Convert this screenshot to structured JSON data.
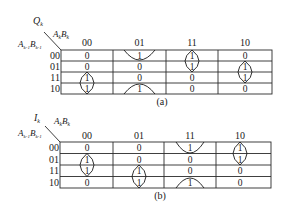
{
  "maps": [
    {
      "id": "a",
      "output_var": "Q",
      "output_sub": "k",
      "col_var": "A",
      "col_var_sub": "k",
      "col_var2": "B",
      "col_var2_sub": "k",
      "row_var": "A",
      "row_var_sub": "k-1",
      "row_var2": "B",
      "row_var2_sub": "k-1",
      "col_headers": [
        "00",
        "01",
        "11",
        "10"
      ],
      "row_headers": [
        "00",
        "01",
        "11",
        "10"
      ],
      "cells": [
        [
          "0",
          "1",
          "1",
          "0"
        ],
        [
          "0",
          "0",
          "1",
          "1"
        ],
        [
          "1",
          "0",
          "0",
          "1"
        ],
        [
          "1",
          "1",
          "0",
          "0"
        ]
      ],
      "groups": [
        {
          "cells": [
            [
              0,
              1
            ],
            [
              3,
              1
            ]
          ],
          "type": "wraparound-vertical"
        },
        {
          "cells": [
            [
              0,
              2
            ],
            [
              1,
              2
            ]
          ],
          "type": "vertical-pair"
        },
        {
          "cells": [
            [
              1,
              3
            ],
            [
              2,
              3
            ]
          ],
          "type": "vertical-pair"
        },
        {
          "cells": [
            [
              2,
              0
            ],
            [
              3,
              0
            ]
          ],
          "type": "vertical-pair"
        }
      ],
      "caption": "(a)"
    },
    {
      "id": "b",
      "output_var": "I",
      "output_sub": "k",
      "col_var": "A",
      "col_var_sub": "k",
      "col_var2": "B",
      "col_var2_sub": "k",
      "row_var": "A",
      "row_var_sub": "k-1",
      "row_var2": "B",
      "row_var2_sub": "k-1",
      "col_headers": [
        "00",
        "01",
        "11",
        "10"
      ],
      "row_headers": [
        "00",
        "01",
        "11",
        "10"
      ],
      "cells": [
        [
          "0",
          "0",
          "1",
          "1"
        ],
        [
          "1",
          "0",
          "0",
          "1"
        ],
        [
          "1",
          "1",
          "0",
          "0"
        ],
        [
          "0",
          "1",
          "1",
          "0"
        ]
      ],
      "groups": [
        {
          "cells": [
            [
              0,
              2
            ],
            [
              3,
              2
            ]
          ],
          "type": "wraparound-vertical"
        },
        {
          "cells": [
            [
              0,
              3
            ],
            [
              1,
              3
            ]
          ],
          "type": "vertical-pair"
        },
        {
          "cells": [
            [
              1,
              0
            ],
            [
              2,
              0
            ]
          ],
          "type": "vertical-pair"
        },
        {
          "cells": [
            [
              2,
              1
            ],
            [
              3,
              1
            ]
          ],
          "type": "vertical-pair"
        }
      ],
      "caption": "(b)"
    }
  ]
}
